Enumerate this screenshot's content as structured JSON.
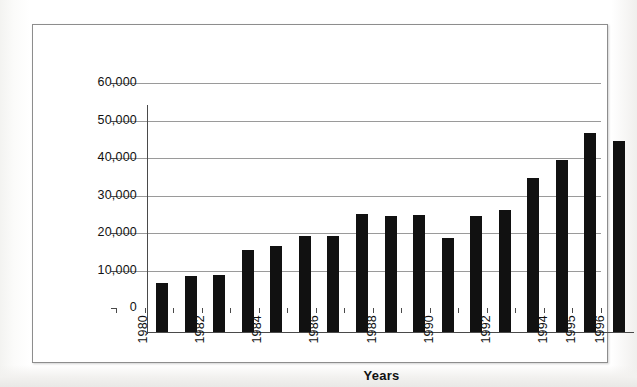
{
  "chart_data": {
    "type": "bar",
    "title": "",
    "xlabel": "Years",
    "ylabel": "",
    "categories": [
      "1980",
      "1981",
      "1982",
      "1983",
      "1984",
      "1985",
      "1986",
      "1987",
      "1988",
      "1989",
      "1990",
      "1991",
      "1992",
      "1993",
      "1994",
      "1995",
      "1996"
    ],
    "values": [
      13000,
      15000,
      15300,
      22000,
      23000,
      25500,
      25500,
      31500,
      31000,
      31200,
      25000,
      31000,
      32500,
      41000,
      46000,
      53000,
      51000
    ],
    "ylim": [
      0,
      60000
    ],
    "ytick_values": [
      0,
      10000,
      20000,
      30000,
      40000,
      50000,
      60000
    ],
    "ytick_labels": [
      "0",
      "10,000",
      "20,000",
      "30,000",
      "40,000",
      "50,000",
      "60,000"
    ],
    "xtick_labels_visible": [
      "1980",
      "1982",
      "1984",
      "1986",
      "1988",
      "1990",
      "1992",
      "1994",
      "1995",
      "1996"
    ],
    "xtick_label_indices": [
      0,
      2,
      4,
      6,
      8,
      10,
      12,
      14,
      15,
      16
    ],
    "xtick_label_rotation": -90,
    "grid": true,
    "grid_axis": "y",
    "legend": "none",
    "bar_color": "#111111",
    "gridline_color": "#9a9a9a",
    "axis_color": "#4a4a4a",
    "plot_background": "#ffffff"
  },
  "frame": {
    "border_color": "#8d8d8d",
    "background": "#ffffff"
  }
}
